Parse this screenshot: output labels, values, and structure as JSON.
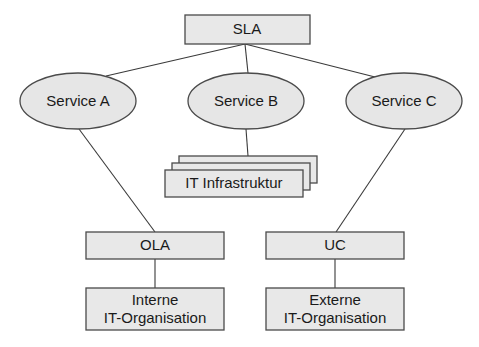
{
  "diagram": {
    "type": "hierarchy",
    "nodes": {
      "sla": {
        "label": "SLA",
        "shape": "rectangle"
      },
      "service_a": {
        "label": "Service A",
        "shape": "ellipse"
      },
      "service_b": {
        "label": "Service B",
        "shape": "ellipse"
      },
      "service_c": {
        "label": "Service C",
        "shape": "ellipse"
      },
      "it_infra": {
        "label": "IT Infrastruktur",
        "shape": "stacked-rectangles"
      },
      "ola": {
        "label": "OLA",
        "shape": "rectangle"
      },
      "uc": {
        "label": "UC",
        "shape": "rectangle"
      },
      "interne": {
        "line1": "Interne",
        "line2": "IT-Organisation",
        "shape": "rectangle"
      },
      "externe": {
        "line1": "Externe",
        "line2": "IT-Organisation",
        "shape": "rectangle"
      }
    },
    "edges": [
      [
        "SLA",
        "Service A"
      ],
      [
        "SLA",
        "Service B"
      ],
      [
        "SLA",
        "Service C"
      ],
      [
        "Service A",
        "OLA"
      ],
      [
        "Service B",
        "IT Infrastruktur"
      ],
      [
        "Service C",
        "UC"
      ],
      [
        "OLA",
        "Interne IT-Organisation"
      ],
      [
        "UC",
        "Externe IT-Organisation"
      ]
    ],
    "colors": {
      "fill": "#e8e8e8",
      "stroke": "#4a4a4a",
      "text": "#1a1a1a",
      "background": "#ffffff"
    }
  }
}
